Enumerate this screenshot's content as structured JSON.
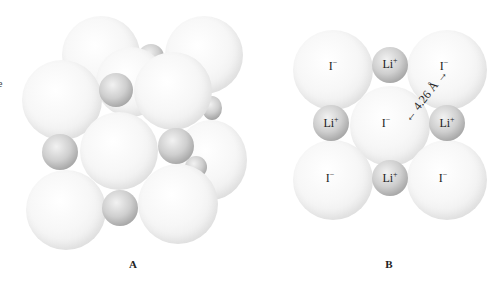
{
  "left_edge_fragment": "e",
  "panels": [
    {
      "id": "A",
      "label": "A",
      "description": "3D packing model of LiI rock-salt structure"
    },
    {
      "id": "B",
      "label": "B",
      "description": "Cross-section of LiI lattice"
    }
  ],
  "panel_b": {
    "ions": [
      {
        "label": "I",
        "charge": "−",
        "pos": "top-left"
      },
      {
        "label": "Li",
        "charge": "+",
        "pos": "top-middle"
      },
      {
        "label": "I",
        "charge": "−",
        "pos": "top-right"
      },
      {
        "label": "Li",
        "charge": "+",
        "pos": "middle-left"
      },
      {
        "label": "I",
        "charge": "−",
        "pos": "center"
      },
      {
        "label": "Li",
        "charge": "+",
        "pos": "middle-right"
      },
      {
        "label": "I",
        "charge": "−",
        "pos": "bottom-left"
      },
      {
        "label": "Li",
        "charge": "+",
        "pos": "bottom-middle"
      },
      {
        "label": "I",
        "charge": "−",
        "pos": "bottom-right"
      }
    ],
    "distance_label": "← 4.26 Å →"
  },
  "colors": {
    "background": "#ffffff",
    "anion": "#f2f2f2",
    "cation": "#a8a8a8",
    "text": "#222222"
  }
}
